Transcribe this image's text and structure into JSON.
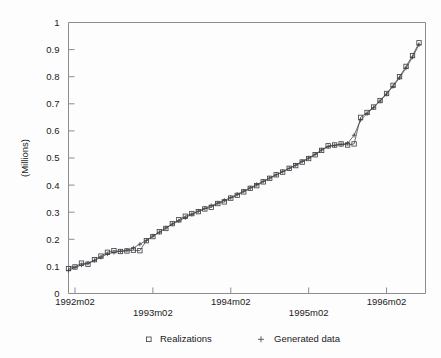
{
  "chart_data": {
    "type": "line",
    "title": "",
    "xlabel": "",
    "ylabel": "(Millions)",
    "ylim": [
      0,
      1
    ],
    "yticks": [
      "0",
      "0.1",
      "0.2",
      "0.3",
      "0.4",
      "0.5",
      "0.6",
      "0.7",
      "0.8",
      "0.9",
      "1"
    ],
    "ytick_values": [
      0,
      0.1,
      0.2,
      0.3,
      0.4,
      0.5,
      0.6,
      0.7,
      0.8,
      0.9,
      1
    ],
    "xticks": [
      "1992m02",
      "1993m02",
      "1994m02",
      "1995m02",
      "1996m02"
    ],
    "xtick_values": [
      1,
      13,
      25,
      37,
      49
    ],
    "xlim": [
      0,
      55
    ],
    "grid": false,
    "legend_position": "bottom",
    "legend": [
      {
        "label": "Realizations",
        "marker": "square"
      },
      {
        "label": "Generated data",
        "marker": "plus"
      }
    ],
    "x": [
      0,
      1,
      2,
      3,
      4,
      5,
      6,
      7,
      8,
      9,
      10,
      11,
      12,
      13,
      14,
      15,
      16,
      17,
      18,
      19,
      20,
      21,
      22,
      23,
      24,
      25,
      26,
      27,
      28,
      29,
      30,
      31,
      32,
      33,
      34,
      35,
      36,
      37,
      38,
      39,
      40,
      41,
      42,
      43,
      44,
      45,
      46,
      47,
      48,
      49,
      50,
      51,
      52,
      53,
      54
    ],
    "series": [
      {
        "name": "Realizations",
        "marker": "square",
        "values": [
          0.092,
          0.098,
          0.112,
          0.108,
          0.125,
          0.138,
          0.152,
          0.158,
          0.155,
          0.157,
          0.16,
          0.158,
          0.195,
          0.21,
          0.228,
          0.24,
          0.258,
          0.272,
          0.285,
          0.295,
          0.302,
          0.312,
          0.318,
          0.332,
          0.338,
          0.352,
          0.362,
          0.375,
          0.388,
          0.398,
          0.412,
          0.425,
          0.438,
          0.448,
          0.462,
          0.472,
          0.485,
          0.498,
          0.512,
          0.528,
          0.545,
          0.548,
          0.552,
          0.548,
          0.552,
          0.65,
          0.668,
          0.688,
          0.712,
          0.738,
          0.768,
          0.8,
          0.838,
          0.878,
          0.925
        ]
      },
      {
        "name": "Generated data",
        "marker": "plus",
        "values": [
          0.085,
          0.096,
          0.105,
          0.112,
          0.122,
          0.134,
          0.146,
          0.152,
          0.156,
          0.16,
          0.168,
          0.182,
          0.196,
          0.212,
          0.226,
          0.242,
          0.256,
          0.268,
          0.28,
          0.292,
          0.304,
          0.314,
          0.324,
          0.334,
          0.344,
          0.354,
          0.366,
          0.378,
          0.39,
          0.402,
          0.414,
          0.426,
          0.438,
          0.45,
          0.462,
          0.474,
          0.488,
          0.5,
          0.514,
          0.53,
          0.542,
          0.546,
          0.55,
          0.554,
          0.584,
          0.64,
          0.664,
          0.686,
          0.71,
          0.736,
          0.764,
          0.796,
          0.832,
          0.872,
          0.918
        ]
      }
    ]
  },
  "colors": {
    "axis": "#8c8c90",
    "marker": "#3c3c40",
    "line": "#4a4a4e",
    "text": "#1a1a1a",
    "background": "#fdfdfe"
  }
}
